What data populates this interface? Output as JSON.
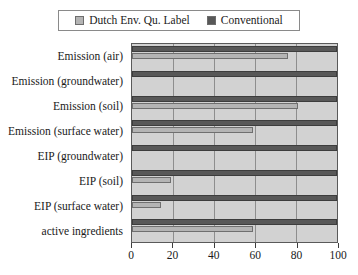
{
  "legend": {
    "entries": [
      {
        "label": "Dutch Env. Qu. Label",
        "color": "#b4b4b4",
        "swatch": "light"
      },
      {
        "label": "Conventional",
        "color": "#585858",
        "swatch": "dark"
      }
    ]
  },
  "axis": {
    "x_ticks": [
      "0",
      "20",
      "40",
      "60",
      "80",
      "100"
    ]
  },
  "chart_data": {
    "type": "bar",
    "orientation": "horizontal",
    "title": "",
    "subtitle": "",
    "xlabel": "",
    "ylabel": "",
    "xlim": [
      0,
      100
    ],
    "xticks": [
      0,
      20,
      40,
      60,
      80,
      100
    ],
    "grid": true,
    "legend_position": "top",
    "categories": [
      "Emission (air)",
      "Emission (groundwater)",
      "Emission (soil)",
      "Emission (surface water)",
      "EIP (groundwater)",
      "EIP (soil)",
      "EIP (surface water)",
      "active ingredients"
    ],
    "series": [
      {
        "name": "Conventional",
        "color": "#585858",
        "values": [
          100,
          100,
          100,
          100,
          100,
          100,
          100,
          100
        ]
      },
      {
        "name": "Dutch Env. Qu. Label",
        "color": "#b4b4b4",
        "values": [
          76,
          0,
          81,
          59,
          0,
          19,
          14,
          59
        ]
      }
    ]
  }
}
